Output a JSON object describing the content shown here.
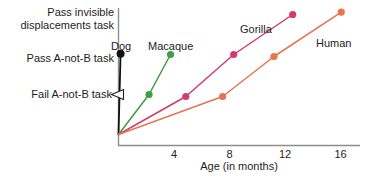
{
  "chart_data": {
    "type": "line",
    "title": "",
    "xlabel": "Age (in months)",
    "ylabel": "",
    "xlim": [
      0,
      17.5
    ],
    "ylim": [
      0,
      3.4
    ],
    "grid": false,
    "legend": "inline-labels",
    "x_ticks": [
      4,
      8,
      12,
      16
    ],
    "x_tick_labels": [
      "4",
      "8",
      "12",
      "16"
    ],
    "y_tick_labels": [
      "Pass invisible displacements task",
      "Pass A-not-B task",
      "Fail A-not-B task"
    ],
    "y_tick_values": [
      3.05,
      2.0,
      1.0
    ],
    "annotations": [
      {
        "name": "fail-task-arrowhead",
        "x": 0,
        "y": 1.0,
        "shape": "left-arrowhead",
        "fill": "#ffffff",
        "stroke": "#1d1d1d"
      }
    ],
    "series": [
      {
        "name": "Dog",
        "color": "#111111",
        "label": "Dog",
        "points": [
          [
            0,
            0
          ],
          [
            0.15,
            2.02
          ]
        ]
      },
      {
        "name": "Macaque",
        "color": "#3d9e43",
        "label": "Macaque",
        "points": [
          [
            0,
            0
          ],
          [
            2.2,
            1.0
          ],
          [
            3.75,
            2.0
          ]
        ]
      },
      {
        "name": "Gorilla",
        "color": "#d13b72",
        "label": "Gorilla",
        "points": [
          [
            0,
            0
          ],
          [
            4.85,
            0.95
          ],
          [
            8.3,
            2.0
          ],
          [
            12.55,
            3.0
          ]
        ]
      },
      {
        "name": "Human",
        "color": "#e8734f",
        "label": "Human",
        "points": [
          [
            0,
            0
          ],
          [
            7.5,
            0.95
          ],
          [
            11.2,
            1.95
          ],
          [
            16.05,
            3.06
          ]
        ]
      }
    ]
  },
  "axis_labels": {
    "pass_invisible_line1": "Pass invisible",
    "pass_invisible_line2": "displacements task",
    "pass_a_not_b": "Pass A-not-B task",
    "fail_a_not_b": "Fail A-not-B task"
  },
  "x_axis": {
    "title": "Age (in months)",
    "ticks": [
      "4",
      "8",
      "12",
      "16"
    ]
  },
  "series_labels": {
    "dog": "Dog",
    "macaque": "Macaque",
    "gorilla": "Gorilla",
    "human": "Human"
  }
}
